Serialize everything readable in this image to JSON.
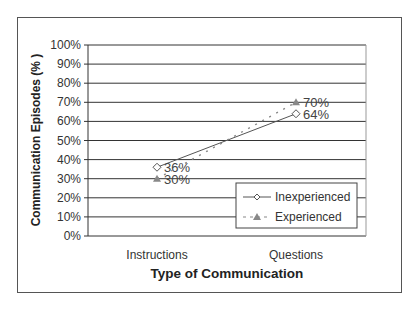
{
  "chart_data": {
    "type": "line",
    "title": "",
    "xlabel": "Type of Communication",
    "ylabel": "Communication Episodes (%)",
    "ylim": [
      0,
      100
    ],
    "yticks": [
      "0%",
      "10%",
      "20%",
      "30%",
      "40%",
      "50%",
      "60%",
      "70%",
      "80%",
      "90%",
      "100%"
    ],
    "categories": [
      "Instructions",
      "Questions"
    ],
    "series": [
      {
        "name": "Inexperienced",
        "values": [
          36,
          64
        ],
        "labels": [
          "36%",
          "64%"
        ],
        "marker": "diamond-open",
        "line": "solid",
        "color": "#555555"
      },
      {
        "name": "Experienced",
        "values": [
          30,
          70
        ],
        "labels": [
          "30%",
          "70%"
        ],
        "marker": "triangle-filled",
        "line": "dotted",
        "color": "#888888"
      }
    ],
    "grid": true,
    "legend_position": "lower-right-inside"
  },
  "axis": {
    "y_title_display": "Communication Episodes (% )"
  }
}
